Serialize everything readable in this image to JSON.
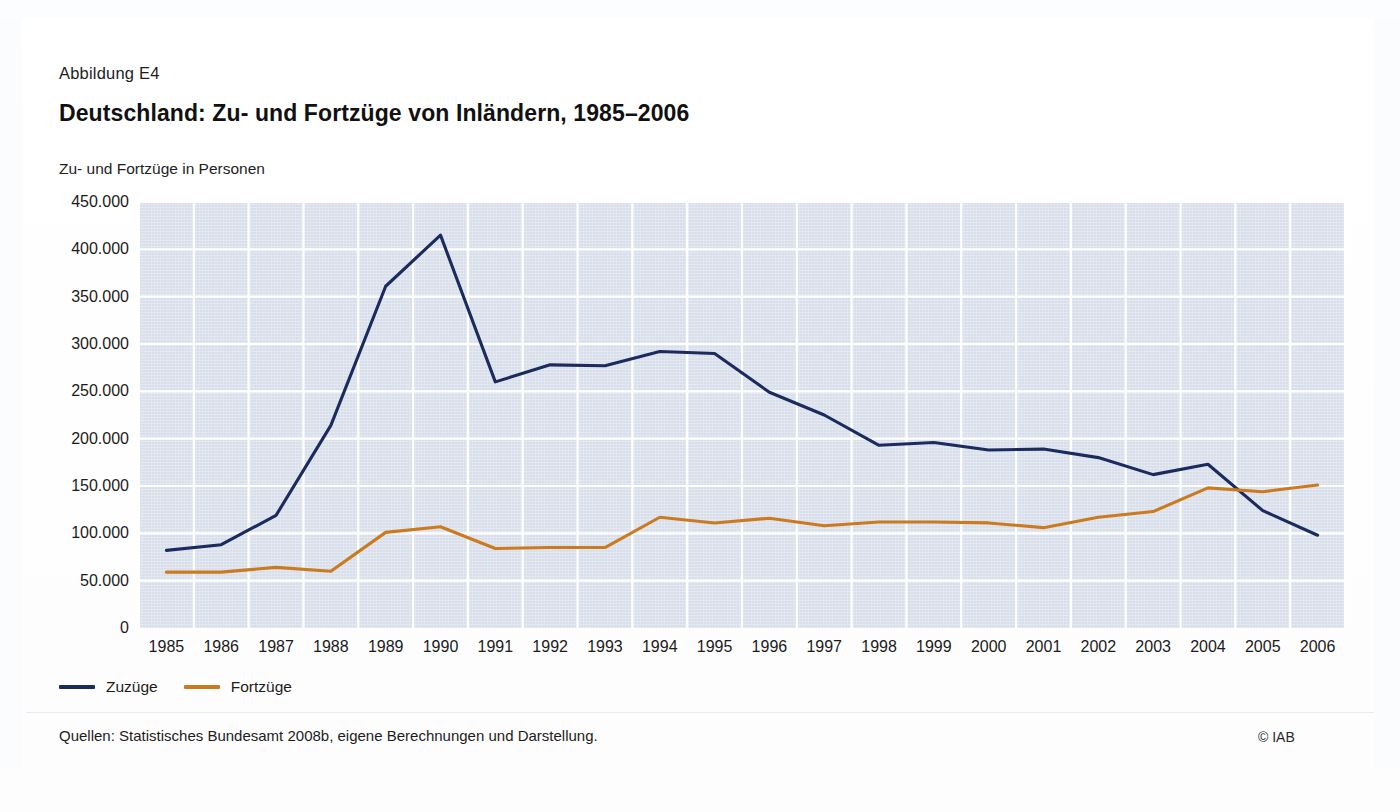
{
  "figure": {
    "label": "Abbildung E4",
    "title": "Deutschland: Zu- und Fortzüge von Inländern, 1985–2006",
    "axis_unit": "Zu- und Fortzüge in Personen",
    "source_note": "Quellen: Statistisches Bundesamt 2008b, eigene Berechnungen und Darstellung.",
    "copyright": "© IAB"
  },
  "colors": {
    "zuzuege": "#1c2b5e",
    "fortzuege": "#cc7a1f",
    "panel": "#d8dfeb",
    "gridline": "#ffffff",
    "page": "#ffffff"
  },
  "chart_data": {
    "type": "line",
    "title": "Deutschland: Zu- und Fortzüge von Inländern, 1985–2006",
    "subtitle": "Abbildung E4",
    "xlabel": "",
    "ylabel": "Zu- und Fortzüge in Personen",
    "ylim": [
      0,
      450000
    ],
    "ytick_step": 50000,
    "ytick_labels": [
      "450.000",
      "400.000",
      "350.000",
      "300.000",
      "250.000",
      "200.000",
      "150.000",
      "100.000",
      "50.000",
      "0"
    ],
    "ytick_values": [
      450000,
      400000,
      350000,
      300000,
      250000,
      200000,
      150000,
      100000,
      50000,
      0
    ],
    "grid": true,
    "legend_position": "below-left",
    "categories": [
      "1985",
      "1986",
      "1987",
      "1988",
      "1989",
      "1990",
      "1991",
      "1992",
      "1993",
      "1994",
      "1995",
      "1996",
      "1997",
      "1998",
      "1999",
      "2000",
      "2001",
      "2002",
      "2003",
      "2004",
      "2005",
      "2006"
    ],
    "series": [
      {
        "name": "Zuzüge",
        "color": "#1c2b5e",
        "values": [
          82000,
          88000,
          119000,
          214000,
          361000,
          415000,
          260000,
          278000,
          277000,
          292000,
          290000,
          249000,
          225000,
          193000,
          196000,
          188000,
          189000,
          180000,
          162000,
          173000,
          124000,
          98000
        ]
      },
      {
        "name": "Fortzüge",
        "color": "#cc7a1f",
        "values": [
          59000,
          59000,
          64000,
          60000,
          101000,
          107000,
          84000,
          85000,
          85000,
          117000,
          111000,
          116000,
          108000,
          112000,
          112000,
          111000,
          106000,
          117000,
          123000,
          148000,
          144000,
          151000
        ]
      }
    ]
  }
}
